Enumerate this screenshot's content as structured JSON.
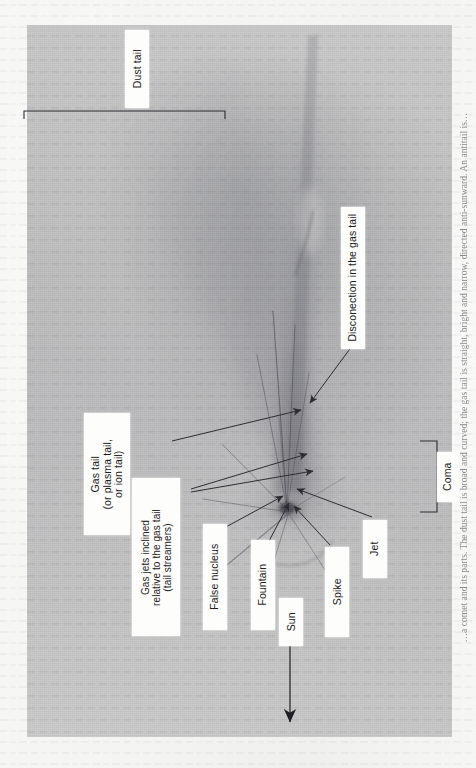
{
  "document": {
    "type": "scanned-book-page",
    "orientation": "rotated-90-ccw",
    "figure_kind": "annotated-comet-photograph"
  },
  "figure": {
    "title_visible": false,
    "photo": {
      "subject": "comet",
      "features": [
        "dust tail",
        "gas tail",
        "coma",
        "nucleus",
        "jets",
        "spike",
        "fountain",
        "disconnection event"
      ]
    },
    "labels": [
      {
        "id": "dust-tail",
        "text": "Dust tail"
      },
      {
        "id": "disconnection",
        "text": "Disconection in the gas tail"
      },
      {
        "id": "gas-tail",
        "text": "Gas tail\n(or plasma tail,\nor ion tail)"
      },
      {
        "id": "gas-jets",
        "text": "Gas jets inclined\nrelative to the gas tail\n(tail streamers)"
      },
      {
        "id": "false-nucleus",
        "text": "False nucleus"
      },
      {
        "id": "fountain",
        "text": "Fountain"
      },
      {
        "id": "spike",
        "text": "Spike"
      },
      {
        "id": "jet",
        "text": "Jet"
      },
      {
        "id": "coma",
        "text": "Coma"
      },
      {
        "id": "sun",
        "text": "Sun"
      }
    ],
    "brackets": [
      {
        "id": "dust-tail-bracket",
        "label": "Dust tail"
      },
      {
        "id": "coma-bracket",
        "label": "Coma"
      }
    ],
    "direction_arrow": {
      "label": "Sun",
      "points_toward": "Sun"
    }
  },
  "caption": {
    "text": "…a comet and its parts. The dust tail is broad and curved; the gas tail is straight, bright and narrow, directed anti-sunward. An antitail is…"
  },
  "colors": {
    "paper": "#f5f5f3",
    "plate": "#c6c6c6",
    "ink": "#1b1b1b",
    "line": "#3b3b41",
    "callout": "#fdfdfb"
  }
}
